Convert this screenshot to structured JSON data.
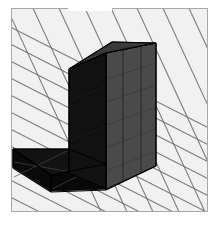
{
  "figure": {
    "view": "isometric",
    "frame": {
      "x": 11,
      "y": 8,
      "width": 197,
      "height": 204,
      "border_color": "#a8a8a8",
      "background_color": "#f2f2f2"
    },
    "notch": {
      "label": "white-notch-top",
      "x": 68,
      "y": 0,
      "width": 44,
      "height": 11,
      "color": "#ffffff"
    }
  },
  "palette": {
    "page_background": "#ffffff",
    "ground_fill": "#f2f2f2",
    "grid_line": "#6b6b6b",
    "grid_line_light": "#9a9a9a",
    "face_front_dark": "#111111",
    "face_arm_dark": "#0d0d0d",
    "face_right_grey": "#4a4a4a",
    "face_top_grey": "#3a3a3a",
    "edge_line": "#000000",
    "frame_border": "#a8a8a8"
  },
  "grid": {
    "type": "isometric-ruled-plane",
    "family_a": {
      "label": "grid-lines-down-right",
      "direction_deg": 27,
      "spacing_px": 17,
      "count": 22,
      "color": "#6b6b6b"
    },
    "family_b": {
      "label": "grid-lines-down-left",
      "direction_deg": -56,
      "spacing_px": 26,
      "count": 18,
      "color": "#6b6b6b"
    }
  },
  "solid": {
    "name": "l-shaped-block",
    "faces": [
      {
        "name": "column-front-face",
        "shade": "dark",
        "color": "#111111",
        "points": "68,68 105,52 105,188 68,172"
      },
      {
        "name": "column-right-face",
        "shade": "medium-grey",
        "color": "#4a4a4a",
        "points": "105,52 155,42 155,165 105,188"
      },
      {
        "name": "column-top-face",
        "shade": "dark-grey",
        "color": "#3a3a3a",
        "points": "68,68 111,41 155,42 105,52"
      },
      {
        "name": "arm-top-face",
        "shade": "near-black",
        "color": "#121212",
        "points": "12,148 68,148 105,163 50,174"
      },
      {
        "name": "arm-front-face",
        "shade": "black",
        "color": "#0a0a0a",
        "points": "12,148 50,174 50,190 12,166"
      },
      {
        "name": "arm-right-face",
        "shade": "black",
        "color": "#080808",
        "points": "50,174 105,163 105,188 50,190"
      }
    ],
    "edges": [
      {
        "name": "column-left-vertical-edge",
        "x1": 68,
        "y1": 68,
        "x2": 68,
        "y2": 172
      },
      {
        "name": "column-inner-vertical-edge",
        "x1": 105,
        "y1": 52,
        "x2": 105,
        "y2": 188
      },
      {
        "name": "column-right-vertical-edge",
        "x1": 155,
        "y1": 42,
        "x2": 155,
        "y2": 165
      },
      {
        "name": "column-top-back-edge",
        "x1": 68,
        "y1": 68,
        "x2": 111,
        "y2": 41
      },
      {
        "name": "column-top-right-edge",
        "x1": 111,
        "y1": 41,
        "x2": 155,
        "y2": 42
      },
      {
        "name": "column-top-front-edge",
        "x1": 68,
        "y1": 68,
        "x2": 105,
        "y2": 52
      },
      {
        "name": "column-top-side-edge",
        "x1": 105,
        "y1": 52,
        "x2": 155,
        "y2": 42
      },
      {
        "name": "column-base-right-edge",
        "x1": 105,
        "y1": 188,
        "x2": 155,
        "y2": 165
      },
      {
        "name": "arm-top-left-edge",
        "x1": 12,
        "y1": 148,
        "x2": 68,
        "y2": 148
      },
      {
        "name": "arm-top-diagonal-edge",
        "x1": 12,
        "y1": 148,
        "x2": 50,
        "y2": 174
      },
      {
        "name": "arm-bottom-diagonal-edge",
        "x1": 12,
        "y1": 166,
        "x2": 50,
        "y2": 190
      },
      {
        "name": "arm-front-bottom-edge",
        "x1": 50,
        "y1": 190,
        "x2": 105,
        "y2": 188
      },
      {
        "name": "arm-interior-diagonal",
        "x1": 50,
        "y1": 174,
        "x2": 105,
        "y2": 163
      },
      {
        "name": "arm-left-vertical-edge",
        "x1": 12,
        "y1": 148,
        "x2": 12,
        "y2": 166
      }
    ],
    "surface_grid_lines": [
      {
        "name": "right-face-grid-v1",
        "x1": 122,
        "y1": 49,
        "x2": 122,
        "y2": 181
      },
      {
        "name": "right-face-grid-v2",
        "x1": 140,
        "y1": 45,
        "x2": 140,
        "y2": 172
      },
      {
        "name": "right-face-grid-h1",
        "x1": 105,
        "y1": 95,
        "x2": 155,
        "y2": 80
      },
      {
        "name": "right-face-grid-h2",
        "x1": 105,
        "y1": 130,
        "x2": 155,
        "y2": 113
      },
      {
        "name": "arm-face-grid-h1",
        "x1": 13,
        "y1": 162,
        "x2": 104,
        "y2": 177
      }
    ]
  }
}
